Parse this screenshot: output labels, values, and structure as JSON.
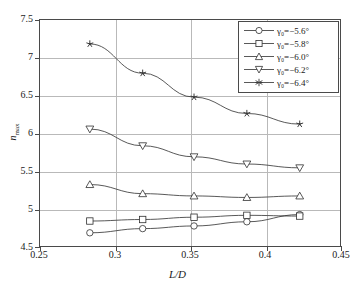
{
  "chart_data": {
    "type": "line",
    "title": "",
    "xlabel": "L/D",
    "ylabel": "n_max",
    "xlim": [
      0.25,
      0.45
    ],
    "ylim": [
      4.5,
      7.5
    ],
    "xticks": [
      "0.25",
      "0.3",
      "0.35",
      "0.4",
      "0.45"
    ],
    "xtick_values": [
      0.25,
      0.3,
      0.35,
      0.4,
      0.45
    ],
    "yticks": [
      "7.5",
      "7",
      "6.5",
      "6",
      "5.5",
      "5",
      "4.5"
    ],
    "ytick_values": [
      7.5,
      7.0,
      6.5,
      6.0,
      5.5,
      5.0,
      4.5
    ],
    "grid": true,
    "legend_position": "top-right",
    "x": [
      0.283,
      0.318,
      0.352,
      0.387,
      0.422
    ],
    "series": [
      {
        "name": "gamma0_-5.6",
        "label": "γ₀=−5.6°",
        "marker": "circle",
        "values": [
          4.7,
          4.755,
          4.79,
          4.845,
          4.94
        ]
      },
      {
        "name": "gamma0_-5.8",
        "label": "γ₀=−5.8°",
        "marker": "square",
        "values": [
          4.855,
          4.875,
          4.905,
          4.93,
          4.92
        ]
      },
      {
        "name": "gamma0_-6.0",
        "label": "γ₀=−6.0°",
        "marker": "triangle-up",
        "values": [
          5.335,
          5.215,
          5.185,
          5.165,
          5.185
        ]
      },
      {
        "name": "gamma0_-6.2",
        "label": "γ₀=−6.2°",
        "marker": "triangle-down",
        "values": [
          6.065,
          5.845,
          5.7,
          5.605,
          5.555
        ]
      },
      {
        "name": "gamma0_-6.4",
        "label": "γ₀=−6.4°",
        "marker": "star",
        "values": [
          7.185,
          6.8,
          6.485,
          6.27,
          6.13
        ]
      }
    ]
  },
  "legend": {
    "entries": [
      {
        "symbol": "gamma",
        "sub": "0",
        "eq": "=−5.6",
        "deg": "°"
      },
      {
        "symbol": "gamma",
        "sub": "0",
        "eq": "=−5.8",
        "deg": "°"
      },
      {
        "symbol": "gamma",
        "sub": "0",
        "eq": "=−6.0",
        "deg": "°"
      },
      {
        "symbol": "gamma",
        "sub": "0",
        "eq": "=−6.2",
        "deg": "°"
      },
      {
        "symbol": "gamma",
        "sub": "0",
        "eq": "=−6.4",
        "deg": "°"
      }
    ]
  },
  "axes": {
    "x_title": "L/D",
    "y_title_main": "n",
    "y_title_sub": "max"
  },
  "colors": {
    "line": "#2e2e2e",
    "grid": "#b9b9b9",
    "frame": "#4a4a4a",
    "background": "#ffffff",
    "text": "#1a1a1a"
  }
}
